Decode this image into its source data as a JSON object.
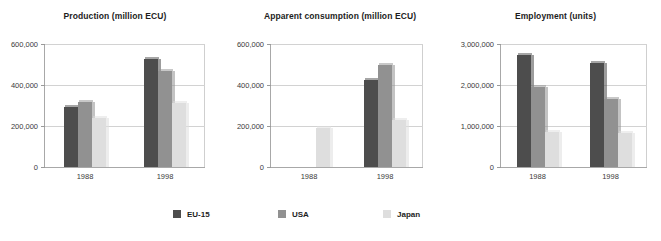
{
  "colors": {
    "eu15": "#4d4d4d",
    "usa": "#919191",
    "japan": "#dedede",
    "axis": "#a8a8a8",
    "grid": "#d2d2d2",
    "text": "#3a3a3a"
  },
  "legend": {
    "items": [
      {
        "label": "EU-15",
        "color": "#4d4d4d",
        "swatch_name": "legend-swatch-eu15"
      },
      {
        "label": "USA",
        "color": "#919191",
        "swatch_name": "legend-swatch-usa"
      },
      {
        "label": "Japan",
        "color": "#dedede",
        "swatch_name": "legend-swatch-japan"
      }
    ]
  },
  "chart_data": [
    {
      "type": "bar",
      "title": "Production (million ECU)",
      "xlabel": "",
      "ylabel": "",
      "categories": [
        "1988",
        "1998"
      ],
      "ylim": [
        0,
        600000
      ],
      "yticks": [
        0,
        200000,
        400000,
        600000
      ],
      "ytick_labels": [
        "0",
        "200,000",
        "400,000",
        "600,000"
      ],
      "grid": true,
      "legend_position": "bottom",
      "series": [
        {
          "name": "EU-15",
          "color": "#4d4d4d",
          "values": [
            295000,
            525000
          ]
        },
        {
          "name": "USA",
          "color": "#919191",
          "values": [
            315000,
            470000
          ]
        },
        {
          "name": "Japan",
          "color": "#dedede",
          "values": [
            240000,
            310000
          ]
        }
      ]
    },
    {
      "type": "bar",
      "title": "Apparent consumption (million ECU)",
      "xlabel": "",
      "ylabel": "",
      "categories": [
        "1988",
        "1998"
      ],
      "ylim": [
        0,
        600000
      ],
      "yticks": [
        0,
        200000,
        400000,
        600000
      ],
      "ytick_labels": [
        "0",
        "200,000",
        "400,000",
        "600,000"
      ],
      "grid": true,
      "legend_position": "bottom",
      "series": [
        {
          "name": "EU-15",
          "color": "#4d4d4d",
          "values": [
            0,
            425000
          ]
        },
        {
          "name": "USA",
          "color": "#919191",
          "values": [
            0,
            500000
          ]
        },
        {
          "name": "Japan",
          "color": "#dedede",
          "values": [
            190000,
            230000
          ]
        }
      ]
    },
    {
      "type": "bar",
      "title": "Employment (units)",
      "xlabel": "",
      "ylabel": "",
      "categories": [
        "1988",
        "1998"
      ],
      "ylim": [
        0,
        3000000
      ],
      "yticks": [
        0,
        1000000,
        2000000,
        3000000
      ],
      "ytick_labels": [
        "0",
        "1,000,000",
        "2,000,000",
        "3,000,000"
      ],
      "grid": true,
      "legend_position": "bottom",
      "series": [
        {
          "name": "EU-15",
          "color": "#4d4d4d",
          "values": [
            2720000,
            2540000
          ]
        },
        {
          "name": "USA",
          "color": "#919191",
          "values": [
            1960000,
            1660000
          ]
        },
        {
          "name": "Japan",
          "color": "#dedede",
          "values": [
            850000,
            840000
          ]
        }
      ]
    }
  ]
}
